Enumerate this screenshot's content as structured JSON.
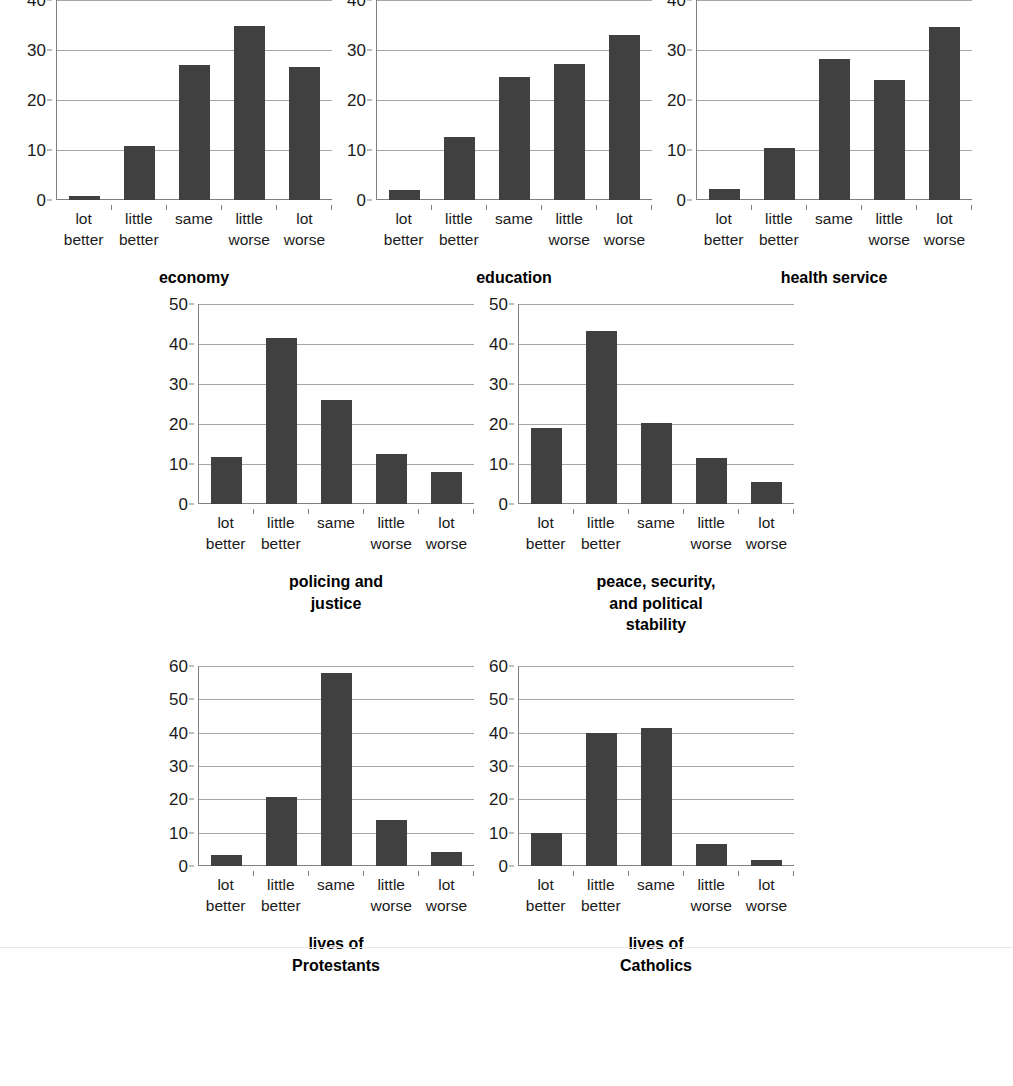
{
  "categories": [
    "lot better",
    "little better",
    "same",
    "little worse",
    "lot worse"
  ],
  "category_lines": [
    [
      "lot",
      "better"
    ],
    [
      "little",
      "better"
    ],
    [
      "same",
      ""
    ],
    [
      "little",
      "worse"
    ],
    [
      "lot",
      "worse"
    ]
  ],
  "colors": {
    "bar": "#404040",
    "gridline": "#a6a6a6",
    "axis": "#808080",
    "text": "#1a1a1a",
    "background": "#ffffff"
  },
  "chart_data": [
    {
      "type": "bar",
      "title": "economy",
      "title_lines": [
        "economy"
      ],
      "categories": [
        "lot better",
        "little better",
        "same",
        "little worse",
        "lot worse"
      ],
      "values": [
        0.9,
        10.9,
        27.0,
        34.9,
        26.6
      ],
      "xlabel": "",
      "ylabel": "",
      "ylim": [
        0,
        40
      ],
      "yticks": [
        0,
        10,
        20,
        30,
        40
      ],
      "grid": true,
      "legend": "none"
    },
    {
      "type": "bar",
      "title": "education",
      "title_lines": [
        "education"
      ],
      "categories": [
        "lot better",
        "little better",
        "same",
        "little worse",
        "lot worse"
      ],
      "values": [
        2.0,
        12.6,
        24.7,
        27.3,
        33.0
      ],
      "xlabel": "",
      "ylabel": "",
      "ylim": [
        0,
        40
      ],
      "yticks": [
        0,
        10,
        20,
        30,
        40
      ],
      "grid": true,
      "legend": "none"
    },
    {
      "type": "bar",
      "title": "health service",
      "title_lines": [
        "health service"
      ],
      "categories": [
        "lot better",
        "little better",
        "same",
        "little worse",
        "lot worse"
      ],
      "values": [
        2.3,
        10.4,
        28.2,
        24.0,
        34.7
      ],
      "xlabel": "",
      "ylabel": "",
      "ylim": [
        0,
        40
      ],
      "yticks": [
        0,
        10,
        20,
        30,
        40
      ],
      "grid": true,
      "legend": "none"
    },
    {
      "type": "bar",
      "title": "policing and justice",
      "title_lines": [
        "policing and",
        "justice"
      ],
      "categories": [
        "lot better",
        "little better",
        "same",
        "little worse",
        "lot worse"
      ],
      "values": [
        11.8,
        41.6,
        26.0,
        12.5,
        8.0
      ],
      "xlabel": "",
      "ylabel": "",
      "ylim": [
        0,
        50
      ],
      "yticks": [
        0,
        10,
        20,
        30,
        40,
        50
      ],
      "grid": true,
      "legend": "none"
    },
    {
      "type": "bar",
      "title": "peace, security, and political stability",
      "title_lines": [
        "peace, security,",
        "and political",
        "stability"
      ],
      "categories": [
        "lot better",
        "little better",
        "same",
        "little worse",
        "lot worse"
      ],
      "values": [
        19.0,
        43.3,
        20.3,
        11.5,
        5.5
      ],
      "xlabel": "",
      "ylabel": "",
      "ylim": [
        0,
        50
      ],
      "yticks": [
        0,
        10,
        20,
        30,
        40,
        50
      ],
      "grid": true,
      "legend": "none"
    },
    {
      "type": "bar",
      "title": "lives of Protestants",
      "title_lines": [
        "lives of",
        "Protestants"
      ],
      "categories": [
        "lot better",
        "little better",
        "same",
        "little worse",
        "lot worse"
      ],
      "values": [
        3.2,
        20.7,
        58.0,
        13.8,
        4.2
      ],
      "xlabel": "",
      "ylabel": "",
      "ylim": [
        0,
        60
      ],
      "yticks": [
        0,
        10,
        20,
        30,
        40,
        50,
        60
      ],
      "grid": true,
      "legend": "none"
    },
    {
      "type": "bar",
      "title": "lives of Catholics",
      "title_lines": [
        "lives of",
        "Catholics"
      ],
      "categories": [
        "lot better",
        "little better",
        "same",
        "little worse",
        "lot worse"
      ],
      "values": [
        10.0,
        40.0,
        41.3,
        6.7,
        1.7
      ],
      "xlabel": "",
      "ylabel": "",
      "ylim": [
        0,
        60
      ],
      "yticks": [
        0,
        10,
        20,
        30,
        40,
        50,
        60
      ],
      "grid": true,
      "legend": "none"
    }
  ],
  "layout": {
    "rows": [
      {
        "name": "row-top",
        "chart_indices": [
          0,
          1,
          2
        ]
      },
      {
        "name": "row-middle",
        "chart_indices": [
          3,
          4
        ]
      },
      {
        "name": "row-bottom",
        "chart_indices": [
          5,
          6
        ]
      }
    ]
  }
}
